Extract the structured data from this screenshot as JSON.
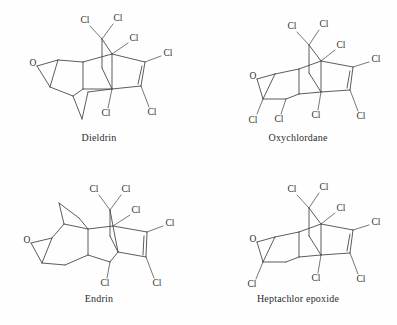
{
  "figure": {
    "background_color": "#fefefe",
    "line_color": "#4a4a4a",
    "text_color": "#2b2b2b",
    "layout": "2x2 grid of chemical structure diagrams"
  },
  "panels": [
    {
      "id": "dieldrin",
      "caption": "Dieldrin",
      "atom_labels": [
        "O",
        "Cl",
        "Cl",
        "Cl",
        "Cl",
        "Cl",
        "Cl"
      ],
      "oxygen_label": "O",
      "chlorine_label": "Cl",
      "chlorine_count": 6,
      "has_epoxide": true,
      "has_double_bond": true
    },
    {
      "id": "oxychlordane",
      "caption": "Oxychlordane",
      "atom_labels": [
        "O",
        "Cl",
        "Cl",
        "Cl",
        "Cl",
        "Cl",
        "Cl",
        "Cl",
        "Cl"
      ],
      "oxygen_label": "O",
      "chlorine_label": "Cl",
      "chlorine_count": 8,
      "has_epoxide": true,
      "has_double_bond": true
    },
    {
      "id": "endrin",
      "caption": "Endrin",
      "atom_labels": [
        "O",
        "Cl",
        "Cl",
        "Cl",
        "Cl",
        "Cl",
        "Cl"
      ],
      "oxygen_label": "O",
      "chlorine_label": "Cl",
      "chlorine_count": 6,
      "has_epoxide": true,
      "has_double_bond": true
    },
    {
      "id": "heptachlor-epoxide",
      "caption": "Heptachlor epoxide",
      "atom_labels": [
        "O",
        "Cl",
        "Cl",
        "Cl",
        "Cl",
        "Cl",
        "Cl",
        "Cl"
      ],
      "oxygen_label": "O",
      "chlorine_label": "Cl",
      "chlorine_count": 7,
      "has_epoxide": true,
      "has_double_bond": true
    }
  ]
}
